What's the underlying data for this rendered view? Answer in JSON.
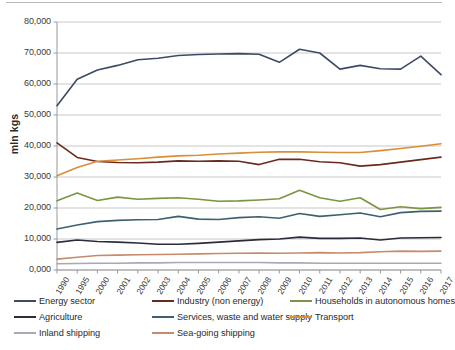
{
  "chart_data": {
    "type": "line",
    "title": "",
    "xlabel": "",
    "ylabel": "mln kgs",
    "ylim": [
      0,
      80000
    ],
    "ytick_step": 10000,
    "ytick_labels": [
      "0,000",
      "10,000",
      "20,000",
      "30,000",
      "40,000",
      "50,000",
      "60,000",
      "70,000",
      "80,000"
    ],
    "grid": true,
    "legend_position": "bottom",
    "categories": [
      "1990",
      "1995",
      "2000",
      "2001",
      "2002",
      "2003",
      "2004",
      "2005",
      "2006",
      "2007",
      "2008",
      "2009",
      "2010",
      "2011",
      "2012",
      "2013",
      "2014",
      "2015",
      "2016",
      "2017"
    ],
    "series": [
      {
        "name": "Energy sector",
        "color": "#3c4a66",
        "values": [
          53000,
          61500,
          64500,
          66000,
          67800,
          68300,
          69200,
          69500,
          69700,
          69800,
          69600,
          67000,
          71200,
          70000,
          64800,
          66000,
          64900,
          64800,
          69000,
          63000
        ]
      },
      {
        "name": "Industry (non energy)",
        "color": "#6b2a20",
        "values": [
          41000,
          36300,
          35000,
          34700,
          34600,
          34800,
          35200,
          35100,
          35200,
          35100,
          34000,
          35700,
          35700,
          34900,
          34600,
          33500,
          34000,
          34800,
          35600,
          36400
        ]
      },
      {
        "name": "Households in autonomous homes",
        "color": "#7b9540",
        "values": [
          22300,
          24800,
          22400,
          23500,
          22800,
          23100,
          23300,
          22800,
          22200,
          22300,
          22600,
          23000,
          25700,
          23300,
          22200,
          23300,
          19500,
          20400,
          19800,
          20200
        ]
      },
      {
        "name": "Agriculture",
        "color": "#2b2b3a",
        "values": [
          8900,
          9700,
          9200,
          9000,
          8700,
          8300,
          8300,
          8600,
          9000,
          9400,
          9800,
          10000,
          10600,
          10200,
          10200,
          10300,
          9700,
          10300,
          10400,
          10500
        ]
      },
      {
        "name": "Services, waste and water supply",
        "color": "#3d6070",
        "values": [
          13200,
          14500,
          15600,
          16000,
          16200,
          16300,
          17300,
          16400,
          16300,
          16900,
          17200,
          16700,
          18200,
          17300,
          17800,
          18400,
          17200,
          18500,
          18900,
          19000
        ]
      },
      {
        "name": "Transport",
        "color": "#d98e37",
        "values": [
          30400,
          33100,
          35100,
          35500,
          35900,
          36400,
          36800,
          37000,
          37400,
          37700,
          38000,
          38100,
          38100,
          38000,
          37900,
          37900,
          38500,
          39200,
          39900,
          40700
        ]
      },
      {
        "name": "Inland shipping",
        "color": "#a6aab5",
        "values": [
          2000,
          2100,
          2200,
          2200,
          2300,
          2300,
          2400,
          2400,
          2400,
          2400,
          2400,
          2300,
          2300,
          2200,
          2200,
          2200,
          2200,
          2200,
          2200,
          2200
        ]
      },
      {
        "name": "Sea-going shipping",
        "color": "#c78a6b",
        "values": [
          3500,
          4100,
          4700,
          4800,
          4900,
          5000,
          5100,
          5200,
          5300,
          5400,
          5500,
          5400,
          5500,
          5600,
          5500,
          5600,
          5900,
          6100,
          6000,
          6100
        ]
      }
    ]
  },
  "legend": {
    "items": [
      {
        "label": "Energy sector",
        "color": "#3c4a66"
      },
      {
        "label": "Industry (non energy)",
        "color": "#6b2a20"
      },
      {
        "label": "Households in autonomous homes",
        "color": "#7b9540"
      },
      {
        "label": "Agriculture",
        "color": "#2b2b3a"
      },
      {
        "label": "Services, waste and water supply",
        "color": "#3d6070"
      },
      {
        "label": "Transport",
        "color": "#d98e37"
      },
      {
        "label": "Inland shipping",
        "color": "#a6aab5"
      },
      {
        "label": "Sea-going shipping",
        "color": "#c78a6b"
      }
    ]
  },
  "axis": {
    "y_title": "mln kgs"
  },
  "colors": {
    "gridline": "#c8c8c8",
    "axis": "#9a9a9a",
    "text": "#3a3a3a",
    "plot_background": "#ffffff"
  }
}
